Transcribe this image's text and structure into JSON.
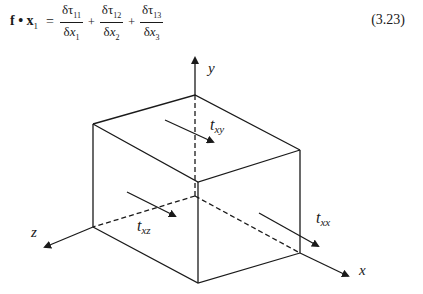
{
  "equation": {
    "lhs_vector": "f",
    "dot": "•",
    "lhs_unit": "x",
    "lhs_sub": "1",
    "equals": "=",
    "terms": [
      {
        "num_symbol": "δτ",
        "num_sub": "11",
        "den_symbol": "δ",
        "den_var": "x",
        "den_sub": "1"
      },
      {
        "num_symbol": "δτ",
        "num_sub": "12",
        "den_symbol": "δ",
        "den_var": "x",
        "den_sub": "2"
      },
      {
        "num_symbol": "δτ",
        "num_sub": "13",
        "den_symbol": "δ",
        "den_var": "x",
        "den_sub": "3"
      }
    ],
    "plus": "+",
    "number": "(3.23)"
  },
  "figure": {
    "axes": {
      "y": "y",
      "z": "z",
      "x": "x"
    },
    "stress_labels": {
      "txy": {
        "base": "t",
        "sub": "xy"
      },
      "txz": {
        "base": "t",
        "sub": "xz"
      },
      "txx": {
        "base": "t",
        "sub": "xx"
      }
    },
    "line_color": "#1a1a1a"
  }
}
